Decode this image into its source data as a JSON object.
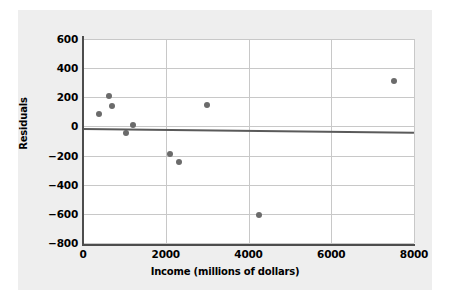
{
  "chart_data": {
    "type": "scatter",
    "title": "",
    "xlabel": "Income (millions of dollars)",
    "ylabel": "Residuals",
    "xlim": [
      0,
      8000
    ],
    "ylim": [
      -800,
      600
    ],
    "xticks": [
      0,
      2000,
      4000,
      6000,
      8000
    ],
    "yticks": [
      600,
      400,
      200,
      0,
      -200,
      -400,
      -600,
      -800
    ],
    "xtick_labels": [
      "0",
      "2000",
      "4000",
      "6000",
      "8000"
    ],
    "ytick_labels": [
      "600",
      "400",
      "200",
      "0",
      "−200",
      "−400",
      "−600",
      "−800"
    ],
    "grid": true,
    "legend": null,
    "points": [
      {
        "x": 380,
        "y": 85
      },
      {
        "x": 640,
        "y": 210
      },
      {
        "x": 700,
        "y": 140
      },
      {
        "x": 1040,
        "y": -45
      },
      {
        "x": 1200,
        "y": 10
      },
      {
        "x": 2100,
        "y": -190
      },
      {
        "x": 2320,
        "y": -245
      },
      {
        "x": 3000,
        "y": 150
      },
      {
        "x": 4250,
        "y": -605
      },
      {
        "x": 7520,
        "y": 315
      }
    ],
    "reference_line": {
      "name": "zero-residual-trend-line",
      "x_start": 0,
      "y_start": -10,
      "x_end": 8000,
      "y_end": -35
    },
    "colors": {
      "point": "#6b6b6b",
      "line": "#5a5a5a",
      "grid": "#c8c8c8",
      "axis": "#4d4d4d",
      "panel_background": "#eeeeee",
      "plot_background": "#ffffff"
    }
  }
}
